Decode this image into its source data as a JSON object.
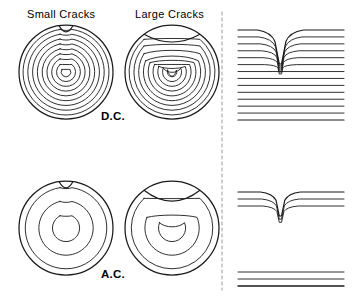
{
  "figure": {
    "title_present": false,
    "background_color": "#ffffff",
    "stroke_color": "#1a1a1a",
    "width": 356,
    "height": 298,
    "labels": {
      "small_cracks": "Small Cracks",
      "large_cracks": "Large Cracks",
      "dc": "D.C.",
      "ac": "A.C."
    },
    "divider": {
      "name": "vertical-dashed-divider",
      "x": 222,
      "y_top": 12,
      "y_bottom": 290,
      "style": "dashed",
      "color": "#9a9a9a"
    },
    "rows": [
      {
        "mode": "D.C.",
        "label": "D.C.",
        "circles": [
          {
            "name": "dc-small-cracks-circle",
            "crack_size": "small",
            "cx": 66,
            "cy": 72,
            "r": 47,
            "ring_count": 9,
            "notch": {
              "type": "small-semicircle",
              "width": 14,
              "depth": 7,
              "position": "top"
            },
            "description": "Concentric circular field rings with a small shallow notch at top"
          },
          {
            "name": "dc-large-cracks-circle",
            "crack_size": "large",
            "cx": 172,
            "cy": 72,
            "r": 47,
            "ring_count": 9,
            "notch": {
              "type": "large-arc",
              "width": 56,
              "depth": 16,
              "position": "top"
            },
            "description": "Distorted U-shaped field rings pulled toward a large notch at top"
          }
        ],
        "profile": {
          "name": "dc-profile-panel",
          "line_count": 14,
          "lines_affected_by_notch": 6,
          "notch": {
            "type": "V-groove",
            "width": 26,
            "depth": 34
          },
          "x_left": 238,
          "x_right": 344,
          "y_top": 30,
          "y_bottom": 120,
          "description": "Side view: 14 flux lines, upper 6 deflected into a deep V notch"
        }
      },
      {
        "mode": "A.C.",
        "label": "A.C.",
        "circles": [
          {
            "name": "ac-small-cracks-circle",
            "crack_size": "small",
            "cx": 66,
            "cy": 228,
            "r": 47,
            "ring_count": 3,
            "notch": {
              "type": "small-semicircle",
              "width": 14,
              "depth": 7,
              "position": "top"
            },
            "description": "Three near-surface rings with a small shallow notch at top"
          },
          {
            "name": "ac-large-cracks-circle",
            "crack_size": "large",
            "cx": 172,
            "cy": 228,
            "r": 47,
            "ring_count": 3,
            "notch": {
              "type": "large-arc",
              "width": 56,
              "depth": 20,
              "position": "top"
            },
            "description": "Three near-surface rings dipping into a broad U at top"
          }
        ],
        "profile": {
          "name": "ac-profile-panel",
          "line_count": 6,
          "lines_affected_by_notch": 3,
          "lines_straight_lower": 3,
          "notch": {
            "type": "V-groove",
            "width": 22,
            "depth": 24
          },
          "x_left": 238,
          "x_right": 344,
          "y_top": 192,
          "y_bottom": 286,
          "description": "Side view: 3 upper flux lines deflected into V notch, 3 straight lines below"
        }
      }
    ]
  }
}
